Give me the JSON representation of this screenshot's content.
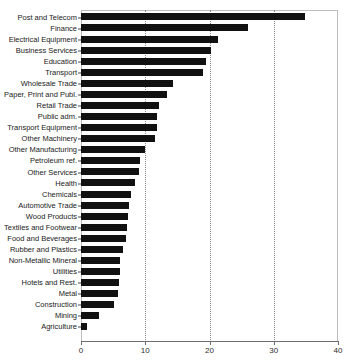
{
  "chart_data": {
    "type": "bar",
    "orientation": "horizontal",
    "title": "",
    "xlabel": "",
    "ylabel": "",
    "xlim": [
      0,
      40
    ],
    "xticks": [
      0,
      10,
      20,
      30,
      40
    ],
    "xtick_labels": [
      "0",
      "10",
      "20",
      "30",
      "40"
    ],
    "gridlines": [
      10,
      20,
      30
    ],
    "grid": true,
    "grid_style": "dotted",
    "legend": null,
    "bar_color": "#111111",
    "categories": [
      "Post and Telecom",
      "Finance",
      "Electrical Equipment",
      "Business Services",
      "Education",
      "Transport",
      "Wholesale Trade",
      "Paper, Print and Publ.",
      "Retail Trade",
      "Public adm.",
      "Transport Equipment",
      "Other Machinery",
      "Other Manufacturing",
      "Petroleum ref.",
      "Other Services",
      "Health",
      "Chemicals",
      "Automotive Trade",
      "Wood Products",
      "Textiles and Footwear",
      "Food and Beverages",
      "Rubber and Plastics",
      "Non-Metallic Mineral",
      "Utilities",
      "Hotels and Rest.",
      "Metal",
      "Construction",
      "Mining",
      "Agriculture"
    ],
    "values": [
      34.9,
      26.0,
      21.4,
      20.2,
      19.4,
      19.0,
      14.3,
      13.4,
      12.1,
      11.9,
      11.8,
      11.5,
      10.0,
      9.2,
      9.1,
      8.4,
      7.8,
      7.4,
      7.3,
      7.2,
      7.0,
      6.6,
      6.1,
      6.0,
      5.9,
      5.8,
      5.2,
      2.8,
      0.9
    ]
  }
}
